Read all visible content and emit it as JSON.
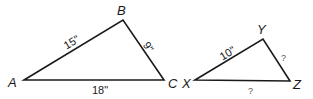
{
  "diagram": {
    "type": "similar-triangles",
    "triangle_abc": {
      "vertices": {
        "A": "A",
        "B": "B",
        "C": "C"
      },
      "sides": {
        "AB": "15\"",
        "BC": "9\"",
        "AC": "18\""
      }
    },
    "triangle_xyz": {
      "vertices": {
        "X": "X",
        "Y": "Y",
        "Z": "Z"
      },
      "sides": {
        "XY": "10\"",
        "YZ": "?",
        "XZ": "?"
      }
    },
    "colors": {
      "stroke": "#1a1a1a",
      "unknown": "#555555",
      "background": "#ffffff"
    }
  }
}
